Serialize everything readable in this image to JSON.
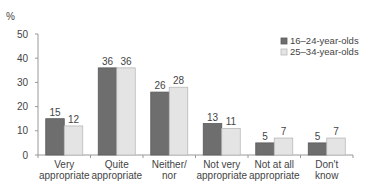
{
  "chart_data": {
    "type": "bar",
    "title": "",
    "ylabel": "%",
    "xlabel": "",
    "ylim": [
      0,
      50
    ],
    "yticks": [
      0,
      10,
      20,
      30,
      40,
      50
    ],
    "grid": false,
    "legend_position": "top-right",
    "categories": [
      [
        "Very",
        "appropriate"
      ],
      [
        "Quite",
        "appropriate"
      ],
      [
        "Neither/",
        "nor"
      ],
      [
        "Not very",
        "appropriate"
      ],
      [
        "Not at all",
        "appropriate"
      ],
      [
        "Don't",
        "know"
      ]
    ],
    "series": [
      {
        "name": "16–24-year-olds",
        "color": "#6e6e6e",
        "values": [
          15,
          36,
          26,
          13,
          5,
          5
        ]
      },
      {
        "name": "25–34-year-olds",
        "color": "#e4e4e4",
        "values": [
          12,
          36,
          28,
          11,
          7,
          7
        ]
      }
    ]
  }
}
